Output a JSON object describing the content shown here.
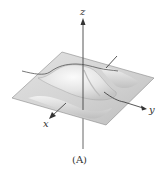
{
  "figure": {
    "caption": "(A)",
    "axes": {
      "x_label": "x",
      "y_label": "y",
      "z_label": "z"
    },
    "colors": {
      "surface_light": "#f4f4f4",
      "surface_mid": "#d9d9d9",
      "surface_dark": "#a8a8a8",
      "axis": "#444444",
      "edge": "#8a8a8a"
    }
  }
}
